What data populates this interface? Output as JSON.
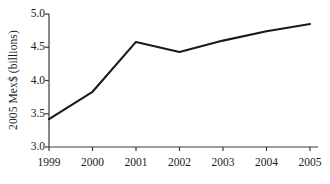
{
  "chart_data": {
    "type": "line",
    "title": "",
    "xlabel": "",
    "ylabel": "2005 Mex$ (billions)",
    "categories": [
      "1999",
      "2000",
      "2001",
      "2002",
      "2003",
      "2004",
      "2005"
    ],
    "x": [
      1999,
      2000,
      2001,
      2002,
      2003,
      2004,
      2005
    ],
    "values": [
      3.42,
      3.83,
      4.58,
      4.43,
      4.6,
      4.74,
      4.85
    ],
    "series": [
      {
        "name": "2005 Mex$ (billions)",
        "values": [
          3.42,
          3.83,
          4.58,
          4.43,
          4.6,
          4.74,
          4.85
        ]
      }
    ],
    "ylim": [
      3.0,
      5.0
    ],
    "xlim": [
      1999,
      2005
    ],
    "yticks": [
      "3.0",
      "3.5",
      "4.0",
      "4.5",
      "5.0"
    ],
    "ytick_values": [
      3.0,
      3.5,
      4.0,
      4.5,
      5.0
    ],
    "xticks": [
      "1999",
      "2000",
      "2001",
      "2002",
      "2003",
      "2004",
      "2005"
    ],
    "grid": false,
    "legend": false,
    "legend_position": "none",
    "line_color": "#1a1a1a",
    "axis_color": "#3a3a3a",
    "background_color": "#ffffff",
    "markers": false
  }
}
